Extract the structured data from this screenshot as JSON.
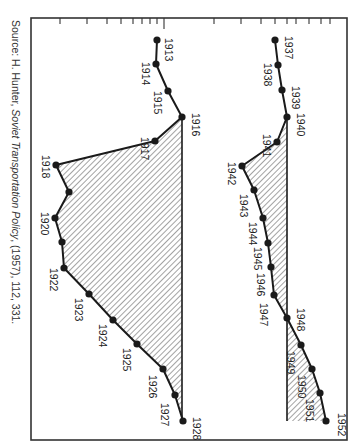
{
  "chart_data": {
    "type": "line",
    "orientation": "rotated-90deg-clockwise",
    "title": "",
    "xlabel": "Year",
    "ylabel": "",
    "y_scale": "log",
    "grid": false,
    "legend": null,
    "frame": {
      "left": 31,
      "right": 347,
      "top": 18,
      "bottom": 440
    },
    "axis_ticks_px": [
      60,
      87,
      107,
      121,
      133,
      142,
      150,
      157,
      164,
      214,
      241,
      261,
      275,
      287,
      296,
      309,
      321,
      330
    ],
    "series": [
      {
        "name": "1913-1928",
        "baseline_year": "1916",
        "shaded_below_baseline": true,
        "points": [
          {
            "year": "1913",
            "px": 157,
            "py": 40,
            "label": true
          },
          {
            "year": "1914",
            "px": 156,
            "py": 64,
            "label": true
          },
          {
            "year": "1915",
            "px": 168,
            "py": 91,
            "label": true
          },
          {
            "year": "1916",
            "px": 182,
            "py": 117,
            "label": true
          },
          {
            "year": "1917",
            "px": 155,
            "py": 141,
            "label": true
          },
          {
            "year": "1918",
            "px": 56,
            "py": 165,
            "label": true
          },
          {
            "year": "1919",
            "px": 69,
            "py": 192,
            "label": false
          },
          {
            "year": "1920",
            "px": 55,
            "py": 218,
            "label": true
          },
          {
            "year": "1921",
            "px": 62,
            "py": 242,
            "label": false
          },
          {
            "year": "1922",
            "px": 64,
            "py": 268,
            "label": true
          },
          {
            "year": "1923",
            "px": 89,
            "py": 294,
            "label": true
          },
          {
            "year": "1924",
            "px": 113,
            "py": 320,
            "label": true
          },
          {
            "year": "1925",
            "px": 137,
            "py": 344,
            "label": true
          },
          {
            "year": "1926",
            "px": 163,
            "py": 369,
            "label": true
          },
          {
            "year": "1927",
            "px": 175,
            "py": 395,
            "label": true
          },
          {
            "year": "1928",
            "px": 183,
            "py": 421,
            "label": true
          }
        ]
      },
      {
        "name": "1937-1952",
        "baseline_year": "1940",
        "shaded_below_baseline": true,
        "points": [
          {
            "year": "1937",
            "px": 275,
            "py": 40,
            "label": true
          },
          {
            "year": "1938",
            "px": 278,
            "py": 65,
            "label": true
          },
          {
            "year": "1939",
            "px": 282,
            "py": 90,
            "label": true
          },
          {
            "year": "1940",
            "px": 287,
            "py": 117,
            "label": true
          },
          {
            "year": "1941",
            "px": 277,
            "py": 142,
            "label": true
          },
          {
            "year": "1942",
            "px": 242,
            "py": 166,
            "label": true
          },
          {
            "year": "1943",
            "px": 254,
            "py": 190,
            "label": true
          },
          {
            "year": "1944",
            "px": 263,
            "py": 218,
            "label": true
          },
          {
            "year": "1945",
            "px": 268,
            "py": 243,
            "label": true
          },
          {
            "year": "1946",
            "px": 271,
            "py": 267,
            "label": true
          },
          {
            "year": "1947",
            "px": 274,
            "py": 295,
            "label": true
          },
          {
            "year": "1948",
            "px": 287,
            "py": 318,
            "label": true
          },
          {
            "year": "1949",
            "px": 301,
            "py": 345,
            "label": true
          },
          {
            "year": "1950",
            "px": 312,
            "py": 369,
            "label": true
          },
          {
            "year": "1951",
            "px": 320,
            "py": 393,
            "label": true
          },
          {
            "year": "1952",
            "px": 326,
            "py": 421,
            "label": true
          }
        ]
      }
    ],
    "label_offsets": {
      "1913": [
        8,
        -2
      ],
      "1914": [
        -14,
        -2
      ],
      "1915": [
        -14,
        0
      ],
      "1916": [
        10,
        -4
      ],
      "1917": [
        -14,
        -4
      ],
      "1918": [
        -14,
        -10
      ],
      "1920": [
        -14,
        -6
      ],
      "1922": [
        -14,
        0
      ],
      "1923": [
        -14,
        4
      ],
      "1924": [
        -14,
        4
      ],
      "1925": [
        -14,
        4
      ],
      "1926": [
        -14,
        6
      ],
      "1927": [
        -14,
        8
      ],
      "1928": [
        10,
        -4
      ],
      "1937": [
        10,
        -4
      ],
      "1938": [
        -14,
        -2
      ],
      "1939": [
        10,
        -4
      ],
      "1940": [
        10,
        -4
      ],
      "1941": [
        -14,
        -8
      ],
      "1942": [
        -14,
        -4
      ],
      "1943": [
        -14,
        4
      ],
      "1944": [
        -14,
        4
      ],
      "1945": [
        -14,
        4
      ],
      "1946": [
        -14,
        6
      ],
      "1947": [
        -14,
        8
      ],
      "1948": [
        10,
        -10
      ],
      "1949": [
        -14,
        6
      ],
      "1950": [
        -14,
        6
      ],
      "1951": [
        -14,
        6
      ],
      "1952": [
        12,
        -8
      ]
    },
    "colors": {
      "line": "#1a1a1a",
      "hatch": "#333333",
      "frame": "#333333",
      "text": "#222222"
    }
  },
  "source": {
    "prefix": "Source: H. Hunter, ",
    "title": "Soviet Transportation Policy",
    "suffix": ", (1957), 112, 331."
  }
}
